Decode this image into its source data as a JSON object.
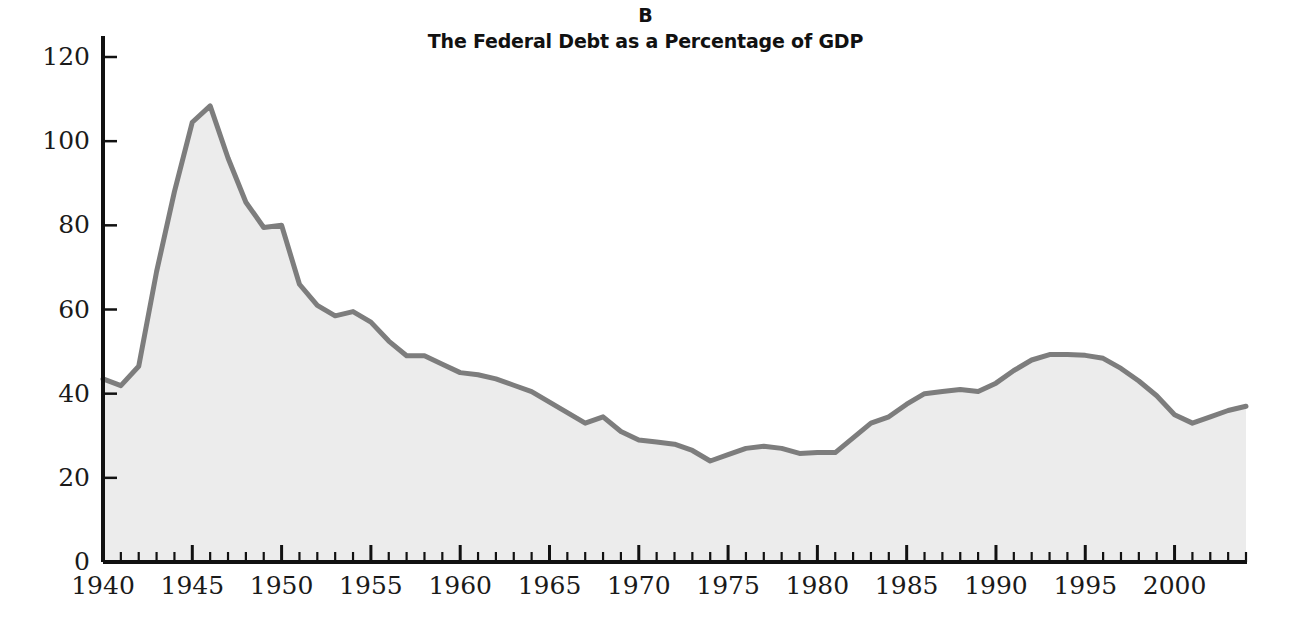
{
  "panel": {
    "letter": "B",
    "title": "The Federal Debt as a Percentage of GDP"
  },
  "axes": {
    "ylabel": "PERCENT",
    "xlabel": "",
    "y_ticks": [
      "0",
      "20",
      "40",
      "60",
      "80",
      "100",
      "120"
    ],
    "x_ticks": [
      "1940",
      "1945",
      "1950",
      "1955",
      "1960",
      "1965",
      "1970",
      "1975",
      "1980",
      "1985",
      "1990",
      "1995",
      "2000"
    ]
  },
  "style": {
    "line_color": "#7d7d7d",
    "fill_color": "#ececec",
    "axis_color": "#111111",
    "text_color": "#1a1a1a",
    "line_width": 5
  },
  "chart_data": {
    "type": "area",
    "title": "The Federal Debt as a Percentage of GDP",
    "subtitle": "B",
    "xlabel": "",
    "ylabel": "PERCENT",
    "xlim": [
      1940,
      2004
    ],
    "ylim": [
      0,
      125
    ],
    "yticks": [
      0,
      20,
      40,
      60,
      80,
      100,
      120
    ],
    "xticks": [
      1940,
      1945,
      1950,
      1955,
      1960,
      1965,
      1970,
      1975,
      1980,
      1985,
      1990,
      1995,
      2000
    ],
    "minor_xtick_interval": 1,
    "grid": false,
    "legend": "none",
    "series": [
      {
        "name": "Federal Debt as % of GDP",
        "x": [
          1940,
          1941,
          1942,
          1943,
          1944,
          1945,
          1946,
          1947,
          1948,
          1949,
          1950,
          1951,
          1952,
          1953,
          1954,
          1955,
          1956,
          1957,
          1958,
          1959,
          1960,
          1961,
          1962,
          1963,
          1964,
          1965,
          1966,
          1967,
          1968,
          1969,
          1970,
          1971,
          1972,
          1973,
          1974,
          1975,
          1976,
          1977,
          1978,
          1979,
          1980,
          1981,
          1982,
          1983,
          1984,
          1985,
          1986,
          1987,
          1988,
          1989,
          1990,
          1991,
          1992,
          1993,
          1994,
          1995,
          1996,
          1997,
          1998,
          1999,
          2000,
          2001,
          2002,
          2003,
          2004
        ],
        "values": [
          43.5,
          41.9,
          46.5,
          69.0,
          88.0,
          104.5,
          108.4,
          96.0,
          85.5,
          79.5,
          80.0,
          66.0,
          61.0,
          58.5,
          59.5,
          57.0,
          52.5,
          49.0,
          49.0,
          47.0,
          45.0,
          44.5,
          43.5,
          42.0,
          40.5,
          38.0,
          35.5,
          33.0,
          34.5,
          31.0,
          29.0,
          28.5,
          28.0,
          26.5,
          24.0,
          25.5,
          27.0,
          27.5,
          27.0,
          25.8,
          26.0,
          26.0,
          29.5,
          33.0,
          34.5,
          37.5,
          40.0,
          40.5,
          41.0,
          40.5,
          42.5,
          45.5,
          48.0,
          49.3,
          49.3,
          49.1,
          48.4,
          46.0,
          43.0,
          39.5,
          35.0,
          33.0,
          34.5,
          36.0,
          37.0
        ]
      }
    ],
    "annotations": {
      "peak": {
        "year": 1946,
        "value": 108.4
      },
      "trough": {
        "year": 1974,
        "value": 24.0
      },
      "secondary_peak": {
        "year": 1993,
        "value": 49.3
      },
      "secondary_trough": {
        "year": 2001,
        "value": 33.0
      },
      "end": {
        "year": 2004,
        "value": 37.0
      }
    }
  }
}
